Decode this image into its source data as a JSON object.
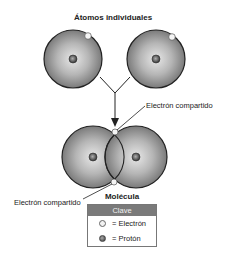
{
  "diagram": {
    "title_top": "Átomos individuales",
    "title_bottom": "Molécula",
    "labels": {
      "shared_electron_top": "Electrón compartido",
      "shared_electron_bottom": "Electrón compartido"
    },
    "key": {
      "header": "Clave",
      "items": [
        {
          "symbol": "electron-icon",
          "label": "= Electrón"
        },
        {
          "symbol": "proton-icon",
          "label": "= Protón"
        }
      ]
    },
    "colors": {
      "atom_fill_light": "#d8d8d8",
      "atom_fill_dark": "#8a8a8a",
      "outline": "#222222",
      "key_header": "#7a7a7a"
    }
  }
}
